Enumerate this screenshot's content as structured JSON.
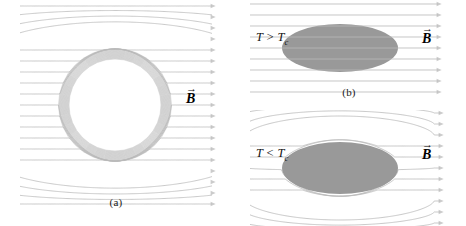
{
  "figure": {
    "background_color": "#ffffff",
    "fieldline_color": "#b9b9b9",
    "body_fill_color": "#999999",
    "label_color": "#141414",
    "width": 466,
    "height": 226
  },
  "panels": [
    {
      "id": "a",
      "caption": "(a)",
      "field_label": "B",
      "field_label_accent": "→",
      "shape": "circle",
      "shape_state": "field-excluded-circulating",
      "temperature_label": null
    },
    {
      "id": "b",
      "caption": "(b)",
      "field_label": "B",
      "field_label_accent": "→",
      "shape": "ellipse",
      "shape_state": "field-penetrating",
      "temperature_label": "T > T",
      "temperature_subscript": "c"
    },
    {
      "id": "c",
      "caption": "(c)",
      "field_label": "B",
      "field_label_accent": "→",
      "shape": "ellipse",
      "shape_state": "field-expelled",
      "temperature_label": "T < T",
      "temperature_subscript": "c"
    }
  ],
  "chart_data": {
    "type": "line",
    "xlabel": "",
    "ylabel": "",
    "grid": false,
    "legend": null,
    "annotations": [
      {
        "panel": "a",
        "text": "B",
        "kind": "vector-label"
      },
      {
        "panel": "a",
        "text": "(a)",
        "kind": "caption"
      },
      {
        "panel": "b",
        "text": "T > T_c",
        "kind": "condition"
      },
      {
        "panel": "b",
        "text": "B",
        "kind": "vector-label"
      },
      {
        "panel": "b",
        "text": "(b)",
        "kind": "caption"
      },
      {
        "panel": "c",
        "text": "T < T_c",
        "kind": "condition"
      },
      {
        "panel": "c",
        "text": "B",
        "kind": "vector-label"
      },
      {
        "panel": "c",
        "text": "(c)",
        "kind": "caption"
      }
    ],
    "series": [
      {
        "name": "panel-a-field-lines",
        "description": "Horizontal field lines deflected around a circular superconducting sphere; lines crowd into a dense annulus at the sphere boundary leaving a white field-free interior.",
        "line_count": 19,
        "x_start": 20,
        "x_end": 212,
        "y_spacing": 11,
        "obstacle": {
          "shape": "circle",
          "cx": 115,
          "cy": 105,
          "r": 56
        }
      },
      {
        "name": "panel-b-field-lines",
        "description": "Straight, undisturbed horizontal field lines passing through a normal-state ellipse above the critical temperature.",
        "line_count": 9,
        "x_start": 18,
        "x_end": 206,
        "y_spacing": 11,
        "obstacle": {
          "shape": "ellipse",
          "cx": 108,
          "cy": 48,
          "rx": 58,
          "ry": 24
        }
      },
      {
        "name": "panel-c-field-lines",
        "description": "Horizontal field lines bending around a superconducting ellipse below the critical temperature; the interior is completely field free.",
        "line_count": 11,
        "x_start": 18,
        "x_end": 208,
        "y_spacing": 11,
        "obstacle": {
          "shape": "ellipse",
          "cx": 108,
          "cy": 58,
          "rx": 58,
          "ry": 26
        }
      }
    ]
  }
}
